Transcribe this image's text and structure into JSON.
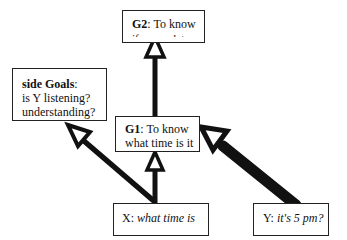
{
  "nodes": {
    "g2": {
      "label_bold": "G2",
      "label_rest": ": To know",
      "line2": "if we are late"
    },
    "side_goals": {
      "label_bold": "side Goals",
      "label_rest": ":",
      "line2": "is Y listening?",
      "line3": "understanding?",
      "line4": "willing?"
    },
    "g1": {
      "label_bold": "G1",
      "label_rest": ": To know",
      "line2": "what time is it"
    },
    "x": {
      "speaker": "X",
      "sep": ": ",
      "utterance": "what time is"
    },
    "y": {
      "speaker": "Y",
      "sep": ": ",
      "utterance": "it's 5 pm?"
    }
  },
  "edges": [
    {
      "from": "g1",
      "to": "g2",
      "weight": "medium"
    },
    {
      "from": "x",
      "to": "g1",
      "weight": "medium"
    },
    {
      "from": "x",
      "to": "side_goals",
      "weight": "medium"
    },
    {
      "from": "y",
      "to": "g1",
      "weight": "heavy"
    }
  ],
  "colors": {
    "stroke": "#111111",
    "box_border": "#222222",
    "background": "#ffffff"
  }
}
